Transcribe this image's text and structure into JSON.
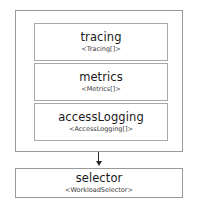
{
  "diagram": {
    "title": "",
    "colors": {
      "outer_border": "#9a9a9a",
      "field_border": "#a8a8a8",
      "arrow": "#2b2b2b",
      "background": "#ffffff",
      "name_text": "#1a1a1a",
      "type_text": "#3a3a3a"
    },
    "group": {
      "label": "",
      "fields": [
        {
          "name": "tracing",
          "type": "<Tracing[]>"
        },
        {
          "name": "metrics",
          "type": "<Metrics[]>"
        },
        {
          "name": "accessLogging",
          "type": "<AccessLogging[]>"
        }
      ]
    },
    "connector": {
      "icon": "arrow-down-icon",
      "direction": "down"
    },
    "selector": {
      "name": "selector",
      "type": "<WorkloadSelector>"
    }
  }
}
